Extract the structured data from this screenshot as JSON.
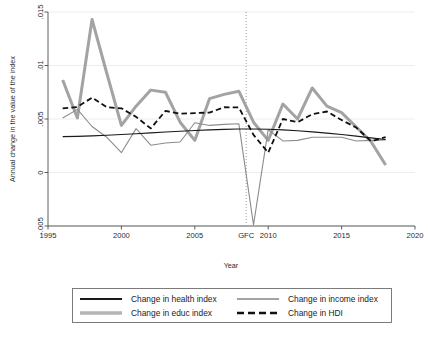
{
  "chart_data": {
    "type": "line",
    "title": "",
    "xlabel": "Year",
    "ylabel": "Annual change in the value of the index",
    "xlim": [
      1995,
      2020
    ],
    "ylim": [
      -0.005,
      0.015
    ],
    "xticks": [
      1995,
      2000,
      2005,
      2010,
      2015,
      2020
    ],
    "xtick_labels": [
      "1995",
      "2000",
      "2005",
      "2010",
      "2015",
      "2020"
    ],
    "yticks": [
      -0.005,
      0,
      0.005,
      0.01,
      0.015
    ],
    "ytick_labels": [
      "-.005",
      "0",
      ".005",
      ".01",
      ".015"
    ],
    "grid": true,
    "legend_position": "below",
    "annotations": [
      {
        "label": "GFC",
        "x": 2008.5,
        "type": "vertical-dotted-line"
      }
    ],
    "x": [
      1996,
      1997,
      1998,
      1999,
      2000,
      2001,
      2002,
      2003,
      2004,
      2005,
      2006,
      2007,
      2008,
      2009,
      2010,
      2011,
      2012,
      2013,
      2014,
      2015,
      2016,
      2017,
      2018
    ],
    "series": [
      {
        "name": "Change in health index",
        "color": "#1a1a1a",
        "style": "solid",
        "width": 1.1,
        "values": [
          0.00335,
          0.00338,
          0.00342,
          0.00348,
          0.00355,
          0.00362,
          0.0037,
          0.00378,
          0.00385,
          0.00392,
          0.00398,
          0.00403,
          0.00406,
          0.00406,
          0.00404,
          0.00398,
          0.0039,
          0.0038,
          0.00368,
          0.00355,
          0.0034,
          0.00324,
          0.00308
        ]
      },
      {
        "name": "Change in educ index",
        "color": "#a3a3a3",
        "style": "solid",
        "width": 3.0,
        "values": [
          0.00865,
          0.0051,
          0.0143,
          0.0093,
          0.0044,
          0.0062,
          0.0077,
          0.0075,
          0.0047,
          0.003,
          0.0069,
          0.0073,
          0.0076,
          0.0047,
          0.003,
          0.0064,
          0.005,
          0.0079,
          0.0062,
          0.0056,
          0.00425,
          0.0029,
          0.0007
        ]
      },
      {
        "name": "Change in income index",
        "color": "#8c8c8c",
        "style": "solid",
        "width": 1.1,
        "values": [
          0.0051,
          0.0059,
          0.0043,
          0.0033,
          0.00185,
          0.0041,
          0.00255,
          0.00275,
          0.00285,
          0.00465,
          0.0044,
          0.0045,
          0.00455,
          -0.0049,
          0.004,
          0.00295,
          0.003,
          0.0033,
          0.0033,
          0.0033,
          0.00295,
          0.003,
          0.00305
        ]
      },
      {
        "name": "Change in HDI",
        "color": "#111111",
        "style": "dashed",
        "width": 1.8,
        "values": [
          0.006,
          0.00612,
          0.007,
          0.0061,
          0.006,
          0.0052,
          0.00412,
          0.00575,
          0.0055,
          0.00555,
          0.0056,
          0.0061,
          0.00608,
          0.00352,
          0.00185,
          0.005,
          0.0047,
          0.00545,
          0.0057,
          0.0049,
          0.0042,
          0.00292,
          0.0033
        ]
      }
    ]
  },
  "legend": {
    "entries": [
      {
        "label": "Change in health index",
        "key": "health"
      },
      {
        "label": "Change in income index",
        "key": "income"
      },
      {
        "label": "Change in educ index",
        "key": "educ"
      },
      {
        "label": "Change in HDI",
        "key": "hdi"
      }
    ]
  },
  "axis": {
    "x_title": "Year",
    "y_title": "Annual change in the value of the index",
    "gfc_label": "GFC"
  }
}
